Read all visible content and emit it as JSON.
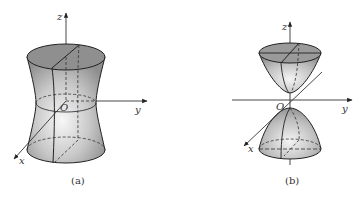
{
  "figures": [
    {
      "id": "a",
      "caption": "(a)",
      "surface": "hyperboloid of one sheet",
      "axes": {
        "z": "z",
        "y": "y",
        "x": "x",
        "origin": "O"
      }
    },
    {
      "id": "b",
      "caption": "(b)",
      "surface": "hyperboloid of two sheets",
      "axes": {
        "z": "z",
        "y": "y",
        "x": "x",
        "origin": "O"
      }
    }
  ],
  "colors": {
    "stroke": "#222222",
    "axis": "#333333",
    "shade_dark": "#8a8a8a",
    "shade_light": "#f2f2f2"
  }
}
